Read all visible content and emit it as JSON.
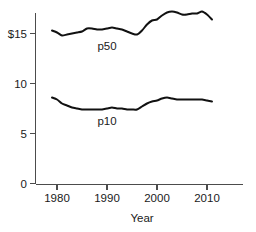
{
  "chart_data": {
    "type": "line",
    "title": "",
    "subtitle": "",
    "xlabel": "Year",
    "ylabel": "",
    "xlim": [
      1978.5,
      2015.0
    ],
    "ylim": [
      0,
      18.5
    ],
    "grid": false,
    "legend_position": "inline-annotations",
    "xticks": [
      1980,
      1990,
      2000,
      2010
    ],
    "xticklabels": [
      "1980",
      "1990",
      "2000",
      "2010"
    ],
    "yticks": [
      0,
      5,
      10,
      15
    ],
    "yticklabels": [
      "0",
      "5",
      "10",
      "$15"
    ],
    "annotations": [
      {
        "text": "p50",
        "x": 1990,
        "y": 13.4
      },
      {
        "text": "p10",
        "x": 1990,
        "y": 5.9
      }
    ],
    "series": [
      {
        "name": "p50",
        "label": "p50",
        "color": "#111111",
        "x": [
          1979,
          1980,
          1981,
          1982,
          1983,
          1984,
          1985,
          1986,
          1987,
          1988,
          1989,
          1990,
          1991,
          1992,
          1993,
          1994,
          1995,
          1996,
          1997,
          1998,
          1999,
          2000,
          2001,
          2002,
          2003,
          2004,
          2005,
          2006,
          2007,
          2008,
          2009,
          2010,
          2011
        ],
        "values": [
          15.3,
          15.1,
          14.8,
          14.9,
          15.0,
          15.1,
          15.2,
          15.5,
          15.5,
          15.4,
          15.4,
          15.5,
          15.6,
          15.5,
          15.4,
          15.2,
          15.0,
          14.9,
          15.3,
          15.9,
          16.3,
          16.4,
          16.8,
          17.1,
          17.2,
          17.1,
          16.9,
          16.9,
          17.0,
          17.0,
          17.2,
          16.9,
          16.4
        ]
      },
      {
        "name": "p10",
        "label": "p10",
        "color": "#111111",
        "x": [
          1979,
          1980,
          1981,
          1982,
          1983,
          1984,
          1985,
          1986,
          1987,
          1988,
          1989,
          1990,
          1991,
          1992,
          1993,
          1994,
          1995,
          1996,
          1997,
          1998,
          1999,
          2000,
          2001,
          2002,
          2003,
          2004,
          2005,
          2006,
          2007,
          2008,
          2009,
          2010,
          2011
        ],
        "values": [
          8.6,
          8.4,
          8.0,
          7.8,
          7.6,
          7.5,
          7.4,
          7.4,
          7.4,
          7.4,
          7.4,
          7.5,
          7.6,
          7.5,
          7.5,
          7.4,
          7.4,
          7.4,
          7.7,
          8.0,
          8.2,
          8.3,
          8.5,
          8.6,
          8.5,
          8.4,
          8.4,
          8.4,
          8.4,
          8.4,
          8.4,
          8.3,
          8.2
        ]
      }
    ]
  }
}
